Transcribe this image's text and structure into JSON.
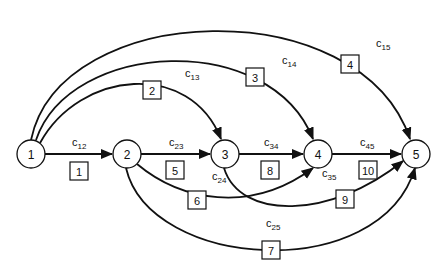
{
  "diagram": {
    "type": "directed-network",
    "nodes": [
      {
        "id": "1",
        "label": "1"
      },
      {
        "id": "2",
        "label": "2"
      },
      {
        "id": "3",
        "label": "3"
      },
      {
        "id": "4",
        "label": "4"
      },
      {
        "id": "5",
        "label": "5"
      }
    ],
    "edges": [
      {
        "from": "1",
        "to": "2",
        "cost_label": "c",
        "cost_sub": "12",
        "index": "1"
      },
      {
        "from": "1",
        "to": "3",
        "cost_label": "c",
        "cost_sub": "13",
        "index": "2"
      },
      {
        "from": "1",
        "to": "4",
        "cost_label": "c",
        "cost_sub": "14",
        "index": "3"
      },
      {
        "from": "1",
        "to": "5",
        "cost_label": "c",
        "cost_sub": "15",
        "index": "4"
      },
      {
        "from": "2",
        "to": "3",
        "cost_label": "c",
        "cost_sub": "23",
        "index": "5"
      },
      {
        "from": "2",
        "to": "4",
        "cost_label": "c",
        "cost_sub": "24",
        "index": "6"
      },
      {
        "from": "2",
        "to": "5",
        "cost_label": "c",
        "cost_sub": "25",
        "index": "7"
      },
      {
        "from": "3",
        "to": "4",
        "cost_label": "c",
        "cost_sub": "34",
        "index": "8"
      },
      {
        "from": "3",
        "to": "5",
        "cost_label": "c",
        "cost_sub": "35",
        "index": "9"
      },
      {
        "from": "4",
        "to": "5",
        "cost_label": "c",
        "cost_sub": "45",
        "index": "10"
      }
    ]
  }
}
